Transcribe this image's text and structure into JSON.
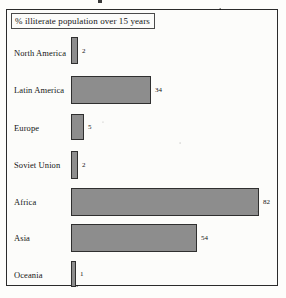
{
  "figure": {
    "title": "% illiterate population over 15 years",
    "frame_color": "#2b2b2b",
    "background_color": "#fcfcfa",
    "bar_fill_color": "#8d8d8d",
    "bar_outline_color": "#2f2f2f"
  },
  "chart_data": {
    "type": "bar",
    "orientation": "horizontal",
    "title": "% illiterate population over 15 years",
    "xlabel": "",
    "ylabel": "",
    "xlim": [
      0,
      82
    ],
    "grid": false,
    "legend": "none",
    "categories": [
      "North America",
      "Latin America",
      "Europe",
      "Soviet Union",
      "Africa",
      "Asia",
      "Oceania"
    ],
    "values": [
      2,
      34,
      5,
      2,
      82,
      54,
      1
    ],
    "value_labels": [
      "2",
      "34",
      "5",
      "2",
      "82",
      "54",
      "1"
    ]
  },
  "rows": [
    {
      "label": "North America",
      "value": "2",
      "bar_width_px": 7,
      "bar_height_px": 27,
      "row_top_px": 1,
      "label_top_px": 12
    },
    {
      "label": "Latin America",
      "value": "34",
      "bar_width_px": 80,
      "bar_height_px": 28,
      "row_top_px": 40,
      "label_top_px": 49
    },
    {
      "label": "Europe",
      "value": "5",
      "bar_width_px": 13,
      "bar_height_px": 26,
      "row_top_px": 78,
      "label_top_px": 87
    },
    {
      "label": "Soviet Union",
      "value": "2",
      "bar_width_px": 7,
      "bar_height_px": 28,
      "row_top_px": 115,
      "label_top_px": 124
    },
    {
      "label": "Africa",
      "value": "82",
      "bar_width_px": 188,
      "bar_height_px": 28,
      "row_top_px": 152,
      "label_top_px": 161
    },
    {
      "label": "Asia",
      "value": "54",
      "bar_width_px": 126,
      "bar_height_px": 28,
      "row_top_px": 188,
      "label_top_px": 197
    },
    {
      "label": "Oceania",
      "value": "1",
      "bar_width_px": 5,
      "bar_height_px": 26,
      "row_top_px": 225,
      "label_top_px": 234
    }
  ]
}
